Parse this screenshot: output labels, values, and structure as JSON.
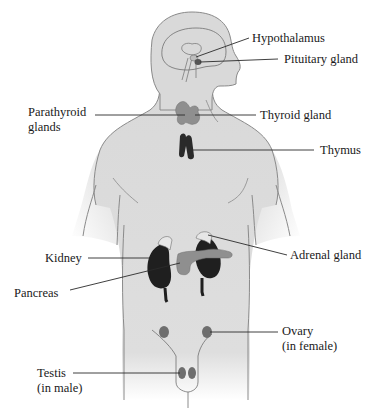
{
  "figure": {
    "type": "diagram",
    "colors": {
      "body_fill": "#d9d9d9",
      "body_outline": "#8a8a8a",
      "gland_gray": "#8f8f8f",
      "gland_dark": "#1f1f1f",
      "leader_line": "#2a2a2a",
      "text": "#1a1a1a",
      "background": "#ffffff"
    }
  },
  "labels": {
    "hypothalamus": "Hypothalamus",
    "pituitary": "Pituitary gland",
    "parathyroid_line1": "Parathyroid",
    "parathyroid_line2": "glands",
    "thyroid": "Thyroid gland",
    "thymus": "Thymus",
    "adrenal": "Adrenal gland",
    "kidney": "Kidney",
    "pancreas": "Pancreas",
    "ovary_line1": "Ovary",
    "ovary_line2": "(in female)",
    "testis_line1": "Testis",
    "testis_line2": "(in male)"
  }
}
